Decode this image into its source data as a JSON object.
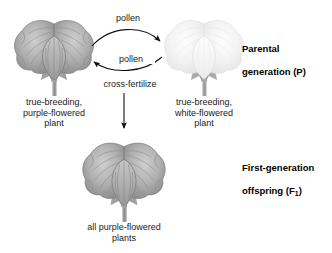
{
  "figure": {
    "background_color": "#ffffff"
  },
  "generation_labels": [
    {
      "id": "parental",
      "line1": "Parental",
      "line2": "generation (P)"
    },
    {
      "id": "f1",
      "line1": "First-generation",
      "line2_pre": "offspring (F",
      "line2_sub": "1",
      "line2_post": ")"
    }
  ],
  "arrow_labels": {
    "pollen_top": "pollen",
    "pollen_bottom": "pollen",
    "cross_fertilize": "cross-fertilize"
  },
  "plants": [
    {
      "id": "purple-parent",
      "flower_color": "#a9a9a9",
      "flower_color_dark": "#8d8d8d",
      "flower_color_light": "#c4c4c4",
      "stem_color": "#9a9a9a",
      "caption": "true-breeding,\npurple-flowered\nplant"
    },
    {
      "id": "white-parent",
      "flower_color": "#f2f2f2",
      "flower_color_dark": "#e0e0e0",
      "flower_color_light": "#fbfbfb",
      "stem_color": "#a5a5a5",
      "caption": "true-breeding,\nwhite-flowered\nplant"
    },
    {
      "id": "f1-offspring",
      "flower_color": "#a9a9a9",
      "flower_color_dark": "#8d8d8d",
      "flower_color_light": "#c4c4c4",
      "stem_color": "#9a9a9a",
      "caption": "all purple-flowered\nplants"
    }
  ],
  "icons": {
    "arrow_right": "arrow-curved-right-icon",
    "arrow_left": "arrow-curved-left-icon",
    "arrow_down": "arrow-down-icon"
  }
}
